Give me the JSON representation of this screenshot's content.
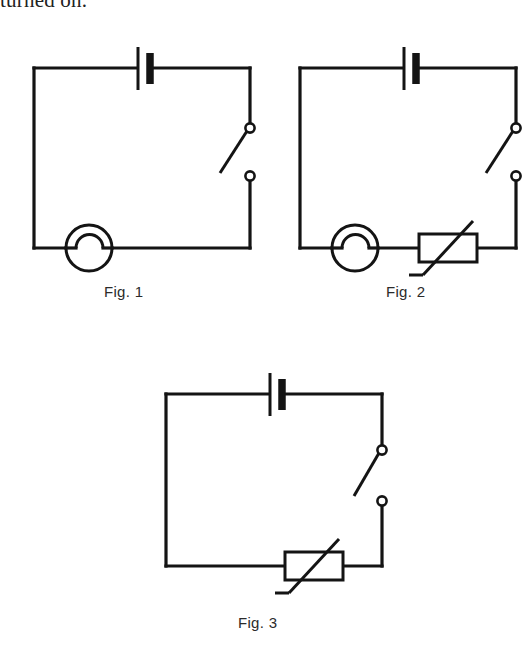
{
  "page": {
    "background_color": "#ffffff",
    "ink_color": "#141414",
    "partial_text_top": "turned on."
  },
  "figures": [
    {
      "id": "fig-1",
      "caption": "Fig. 1",
      "components": [
        {
          "name": "battery",
          "label": "battery-cell"
        },
        {
          "name": "switch",
          "label": "open-switch"
        },
        {
          "name": "lamp",
          "label": "lamp"
        }
      ]
    },
    {
      "id": "fig-2",
      "caption": "Fig. 2",
      "components": [
        {
          "name": "battery",
          "label": "battery-cell"
        },
        {
          "name": "switch",
          "label": "open-switch"
        },
        {
          "name": "lamp",
          "label": "lamp"
        },
        {
          "name": "variable-resistor",
          "label": "variable-resistor"
        }
      ]
    },
    {
      "id": "fig-3",
      "caption": "Fig. 3",
      "components": [
        {
          "name": "battery",
          "label": "battery-cell"
        },
        {
          "name": "switch",
          "label": "open-switch"
        },
        {
          "name": "variable-resistor",
          "label": "variable-resistor"
        }
      ]
    }
  ]
}
